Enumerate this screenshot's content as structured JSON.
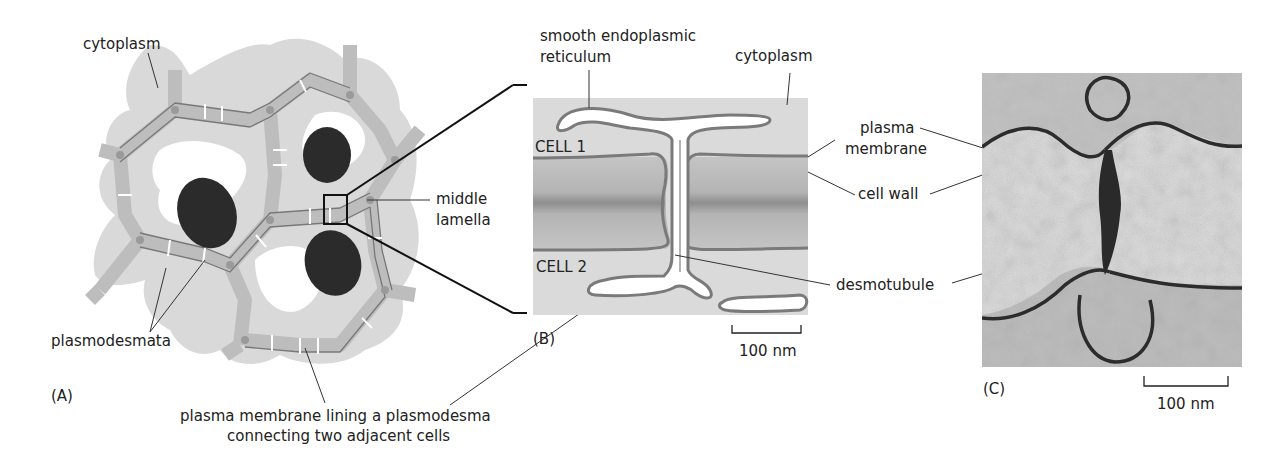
{
  "panel_a": {
    "tag": "(A)",
    "labels": {
      "cytoplasm": "cytoplasm",
      "plasmodesmata": "plasmodesmata",
      "plasma_membrane_line1": "plasma membrane lining a plasmodesma",
      "plasma_membrane_line2": "connecting two adjacent cells"
    },
    "middle_lamella_line1": "middle",
    "middle_lamella_line2": "lamella"
  },
  "panel_b": {
    "tag": "(B)",
    "labels": {
      "ser_line1": "smooth endoplasmic",
      "ser_line2": "reticulum",
      "cytoplasm": "cytoplasm",
      "cell1": "CELL 1",
      "cell2": "CELL 2",
      "scale": "100 nm"
    }
  },
  "shared_labels": {
    "plasma_membrane_line1": "plasma",
    "plasma_membrane_line2": "membrane",
    "cell_wall": "cell wall",
    "desmotubule": "desmotubule"
  },
  "panel_c": {
    "tag": "(C)",
    "scale": "100 nm"
  },
  "colors": {
    "cytoplasm": "#dcdcdc",
    "wall": "#b9b9b9",
    "lamella": "#9a9a9a",
    "membrane": "#777777",
    "nucleus": "#2a2a2a"
  }
}
